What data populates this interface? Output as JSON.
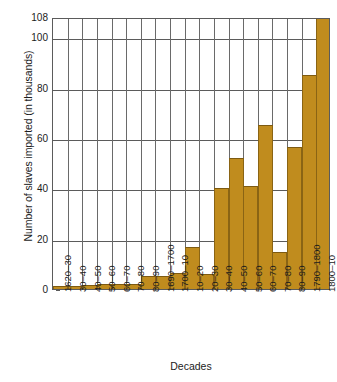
{
  "chart_data": {
    "type": "bar",
    "title": "",
    "xlabel": "Decades",
    "ylabel": "Number of slaves imported (in thousands)",
    "ylim": [
      0,
      108
    ],
    "yticks": [
      0,
      20,
      40,
      60,
      80,
      100,
      108
    ],
    "grid": true,
    "legend": "none",
    "bar_color": "#c08c1e",
    "bar_edge_color": "#8a6414",
    "axis_color": "#5b5b5b",
    "categories": [
      "1620–30",
      "30–40",
      "40–50",
      "50–60",
      "60–70",
      "70–80",
      "80–90",
      "1690–1700",
      "1700–10",
      "10–20",
      "20–30",
      "30–40",
      "40–50",
      "50–60",
      "60–70",
      "70–80",
      "80–90",
      "1790–1800",
      "1800–10"
    ],
    "values": [
      1,
      1,
      1.5,
      2,
      2,
      2,
      5,
      5.2,
      6.5,
      16.5,
      6,
      40,
      52,
      41,
      65,
      14.5,
      56.5,
      85,
      108
    ]
  },
  "caption": ""
}
